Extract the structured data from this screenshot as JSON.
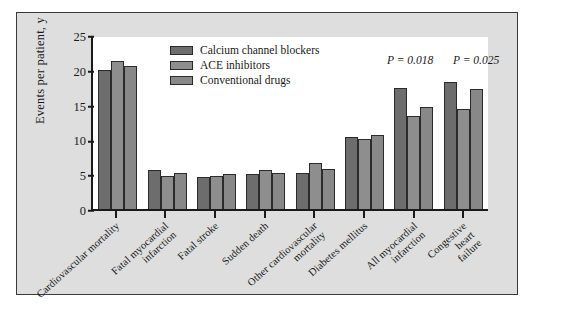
{
  "chart_data": {
    "type": "bar",
    "title": "",
    "xlabel": "",
    "ylabel": "Events per patient, y",
    "ylim": [
      0,
      25
    ],
    "yticks": [
      0,
      5,
      10,
      15,
      20,
      25
    ],
    "grid": false,
    "legend_position": "top-center",
    "categories": [
      "Cardiovascular mortality",
      "Fatal myocardial infarction",
      "Fatal stroke",
      "Sudden death",
      "Other cardiovascular mortality",
      "Diabetes mellitus",
      "All myocardial infarction",
      "Congestive heart failure"
    ],
    "series": [
      {
        "name": "Calcium channel blockers",
        "color": "#6d6d6d",
        "values": [
          20.0,
          5.6,
          4.6,
          5.0,
          5.2,
          10.4,
          17.4,
          18.2
        ]
      },
      {
        "name": "ACE inhibitors",
        "color": "#8e8e8e",
        "values": [
          21.2,
          4.7,
          4.8,
          5.6,
          6.6,
          10.1,
          13.4,
          14.4
        ]
      },
      {
        "name": "Conventional drugs",
        "color": "#888888",
        "values": [
          20.6,
          5.2,
          5.0,
          5.2,
          5.8,
          10.6,
          14.6,
          17.3
        ]
      }
    ],
    "annotations": [
      {
        "text": "P = 0.018",
        "category": "All myocardial infarction"
      },
      {
        "text": "P = 0.025",
        "category": "Congestive heart failure"
      }
    ]
  }
}
